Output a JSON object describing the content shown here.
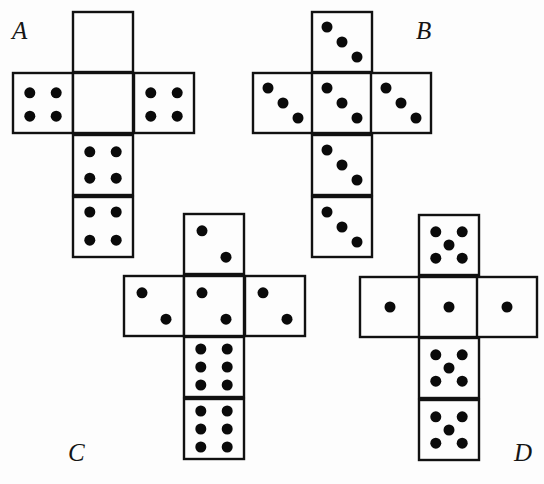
{
  "figure": {
    "nets": [
      {
        "label": "A",
        "label_pos": [
          12,
          18
        ],
        "faces": [
          {
            "name": "top",
            "x": 73,
            "y": 12,
            "pips": []
          },
          {
            "name": "left",
            "x": 13,
            "y": 73,
            "pips": [
              [
                0.28,
                0.33
              ],
              [
                0.72,
                0.33
              ],
              [
                0.28,
                0.72
              ],
              [
                0.72,
                0.72
              ]
            ]
          },
          {
            "name": "center",
            "x": 73,
            "y": 73,
            "pips": []
          },
          {
            "name": "right",
            "x": 134,
            "y": 73,
            "pips": [
              [
                0.28,
                0.33
              ],
              [
                0.72,
                0.33
              ],
              [
                0.28,
                0.72
              ],
              [
                0.72,
                0.72
              ]
            ]
          },
          {
            "name": "bottom1",
            "x": 73,
            "y": 135,
            "pips": [
              [
                0.28,
                0.28
              ],
              [
                0.72,
                0.28
              ],
              [
                0.28,
                0.72
              ],
              [
                0.72,
                0.72
              ]
            ]
          },
          {
            "name": "bottom2",
            "x": 73,
            "y": 197,
            "pips": [
              [
                0.28,
                0.25
              ],
              [
                0.72,
                0.25
              ],
              [
                0.28,
                0.72
              ],
              [
                0.72,
                0.72
              ]
            ]
          }
        ]
      },
      {
        "label": "B",
        "label_pos": [
          416,
          18
        ],
        "faces": [
          {
            "name": "top",
            "x": 312,
            "y": 12,
            "pips": [
              [
                0.25,
                0.25
              ],
              [
                0.5,
                0.5
              ],
              [
                0.75,
                0.75
              ]
            ]
          },
          {
            "name": "left",
            "x": 253,
            "y": 73,
            "pips": [
              [
                0.25,
                0.25
              ],
              [
                0.5,
                0.5
              ],
              [
                0.75,
                0.75
              ]
            ]
          },
          {
            "name": "center",
            "x": 312,
            "y": 73,
            "pips": [
              [
                0.25,
                0.25
              ],
              [
                0.5,
                0.5
              ],
              [
                0.75,
                0.75
              ]
            ]
          },
          {
            "name": "right",
            "x": 371,
            "y": 73,
            "pips": [
              [
                0.25,
                0.25
              ],
              [
                0.5,
                0.5
              ],
              [
                0.75,
                0.75
              ]
            ]
          },
          {
            "name": "bottom1",
            "x": 312,
            "y": 135,
            "pips": [
              [
                0.25,
                0.25
              ],
              [
                0.5,
                0.5
              ],
              [
                0.75,
                0.75
              ]
            ]
          },
          {
            "name": "bottom2",
            "x": 312,
            "y": 197,
            "pips": [
              [
                0.25,
                0.25
              ],
              [
                0.5,
                0.5
              ],
              [
                0.75,
                0.75
              ]
            ]
          }
        ]
      },
      {
        "label": "C",
        "label_pos": [
          68,
          440
        ],
        "faces": [
          {
            "name": "top",
            "x": 184,
            "y": 214,
            "pips": [
              [
                0.3,
                0.28
              ],
              [
                0.7,
                0.72
              ]
            ]
          },
          {
            "name": "left",
            "x": 124,
            "y": 276,
            "pips": [
              [
                0.3,
                0.28
              ],
              [
                0.7,
                0.72
              ]
            ]
          },
          {
            "name": "center",
            "x": 184,
            "y": 276,
            "pips": [
              [
                0.3,
                0.28
              ],
              [
                0.7,
                0.72
              ]
            ]
          },
          {
            "name": "right",
            "x": 245,
            "y": 276,
            "pips": [
              [
                0.3,
                0.28
              ],
              [
                0.7,
                0.72
              ]
            ]
          },
          {
            "name": "bottom1",
            "x": 184,
            "y": 337,
            "pips": [
              [
                0.28,
                0.2
              ],
              [
                0.72,
                0.2
              ],
              [
                0.28,
                0.5
              ],
              [
                0.72,
                0.5
              ],
              [
                0.28,
                0.8
              ],
              [
                0.72,
                0.8
              ]
            ]
          },
          {
            "name": "bottom2",
            "x": 184,
            "y": 399,
            "pips": [
              [
                0.28,
                0.2
              ],
              [
                0.72,
                0.2
              ],
              [
                0.28,
                0.5
              ],
              [
                0.72,
                0.5
              ],
              [
                0.28,
                0.8
              ],
              [
                0.72,
                0.8
              ]
            ]
          }
        ]
      },
      {
        "label": "D",
        "label_pos": [
          514,
          440
        ],
        "faces": [
          {
            "name": "top",
            "x": 419,
            "y": 215,
            "pips": [
              [
                0.28,
                0.28
              ],
              [
                0.72,
                0.28
              ],
              [
                0.5,
                0.5
              ],
              [
                0.28,
                0.72
              ],
              [
                0.72,
                0.72
              ]
            ]
          },
          {
            "name": "left",
            "x": 360,
            "y": 277,
            "pips": [
              [
                0.5,
                0.5
              ]
            ]
          },
          {
            "name": "center",
            "x": 419,
            "y": 277,
            "pips": [
              [
                0.5,
                0.5
              ]
            ]
          },
          {
            "name": "right",
            "x": 477,
            "y": 277,
            "pips": [
              [
                0.5,
                0.5
              ]
            ]
          },
          {
            "name": "bottom1",
            "x": 419,
            "y": 338,
            "pips": [
              [
                0.28,
                0.28
              ],
              [
                0.72,
                0.28
              ],
              [
                0.5,
                0.5
              ],
              [
                0.28,
                0.72
              ],
              [
                0.72,
                0.72
              ]
            ]
          },
          {
            "name": "bottom2",
            "x": 419,
            "y": 400,
            "pips": [
              [
                0.28,
                0.28
              ],
              [
                0.72,
                0.28
              ],
              [
                0.5,
                0.5
              ],
              [
                0.28,
                0.72
              ],
              [
                0.72,
                0.72
              ]
            ]
          }
        ]
      }
    ],
    "face_size": 60,
    "pip_radius": 5.5,
    "colors": {
      "ink": "#111111",
      "paper": "#fdfdfd"
    }
  }
}
